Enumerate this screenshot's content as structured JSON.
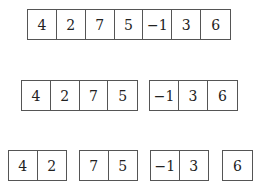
{
  "diagram": {
    "levels": [
      {
        "groups": [
          [
            "4",
            "2",
            "7",
            "5",
            "−1",
            "3",
            "6"
          ]
        ]
      },
      {
        "groups": [
          [
            "4",
            "2",
            "7",
            "5"
          ],
          [
            "−1",
            "3",
            "6"
          ]
        ]
      },
      {
        "groups": [
          [
            "4",
            "2"
          ],
          [
            "7",
            "5"
          ],
          [
            "−1",
            "3"
          ],
          [
            "6"
          ]
        ]
      }
    ]
  }
}
